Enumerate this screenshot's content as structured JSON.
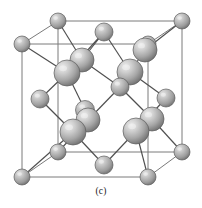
{
  "figure": {
    "caption": "(c)",
    "background_color": "#ffffff",
    "bond_color": "#4a4a4a",
    "cell_edge_color": "#6e6e6e",
    "sphere_color_light": "#d8d8d8",
    "sphere_color_mid": "#a9a9a9",
    "sphere_color_dark": "#6b6b6b",
    "sphere_outline": "#5a5a5a"
  },
  "chart_data": {
    "type": "scatter",
    "xlabel": "",
    "ylabel": "",
    "projection": "oblique",
    "cell": {
      "front_face": [
        [
          22,
          44
        ],
        [
          148,
          44
        ],
        [
          148,
          177
        ],
        [
          22,
          177
        ]
      ],
      "back_face": [
        [
          58,
          21
        ],
        [
          182,
          21
        ],
        [
          182,
          152
        ],
        [
          58,
          152
        ]
      ],
      "depth_offset": [
        36,
        -23
      ]
    },
    "atom_classes": [
      {
        "name": "corner",
        "radius": 8.0,
        "count": 8
      },
      {
        "name": "face-center",
        "radius": 9.0,
        "count": 6
      },
      {
        "name": "interior-tetrahedral",
        "radius": 13.0,
        "count": 4
      }
    ],
    "atoms": [
      {
        "id": "corner-back-top-left",
        "cls": "corner",
        "x": 58,
        "y": 21,
        "r": 8.0
      },
      {
        "id": "corner-back-top-right",
        "cls": "corner",
        "x": 182,
        "y": 21,
        "r": 8.0
      },
      {
        "id": "corner-back-bottom-left",
        "cls": "corner",
        "x": 58,
        "y": 152,
        "r": 8.0
      },
      {
        "id": "corner-back-bottom-right",
        "cls": "corner",
        "x": 182,
        "y": 152,
        "r": 8.0
      },
      {
        "id": "corner-front-top-left",
        "cls": "corner",
        "x": 22,
        "y": 44,
        "r": 8.0
      },
      {
        "id": "corner-front-top-right",
        "cls": "corner",
        "x": 148,
        "y": 44,
        "r": 8.0
      },
      {
        "id": "corner-front-bottom-left",
        "cls": "corner",
        "x": 22,
        "y": 177,
        "r": 8.0
      },
      {
        "id": "corner-front-bottom-right",
        "cls": "corner",
        "x": 148,
        "y": 177,
        "r": 8.0
      },
      {
        "id": "face-top",
        "cls": "face-center",
        "x": 104,
        "y": 32,
        "r": 9.0
      },
      {
        "id": "face-bottom",
        "cls": "face-center",
        "x": 104,
        "y": 165,
        "r": 9.0
      },
      {
        "id": "face-left",
        "cls": "face-center",
        "x": 40,
        "y": 99,
        "r": 9.0
      },
      {
        "id": "face-right",
        "cls": "face-center",
        "x": 166,
        "y": 98,
        "r": 9.0
      },
      {
        "id": "face-front",
        "cls": "face-center",
        "x": 85,
        "y": 110,
        "r": 9.5
      },
      {
        "id": "face-back",
        "cls": "face-center",
        "x": 120,
        "y": 87,
        "r": 9.0
      },
      {
        "id": "interior-upper-left",
        "cls": "interior-tetrahedral",
        "x": 67,
        "y": 73,
        "r": 13.0
      },
      {
        "id": "interior-upper-right",
        "cls": "interior-tetrahedral",
        "x": 130,
        "y": 72,
        "r": 13.0
      },
      {
        "id": "interior-lower-left",
        "cls": "interior-tetrahedral",
        "x": 73,
        "y": 132,
        "r": 13.0
      },
      {
        "id": "interior-lower-right",
        "cls": "interior-tetrahedral",
        "x": 136,
        "y": 131,
        "r": 13.0
      },
      {
        "id": "interior-back-upper-left",
        "cls": "interior-tetrahedral",
        "x": 82,
        "y": 60,
        "r": 12.0
      },
      {
        "id": "interior-back-upper-right",
        "cls": "interior-tetrahedral",
        "x": 145,
        "y": 50,
        "r": 12.0
      },
      {
        "id": "interior-back-lower-left",
        "cls": "interior-tetrahedral",
        "x": 88,
        "y": 120,
        "r": 12.0
      },
      {
        "id": "interior-back-lower-right",
        "cls": "interior-tetrahedral",
        "x": 152,
        "y": 119,
        "r": 12.0
      }
    ],
    "bonds": [
      [
        "interior-upper-left",
        "corner-front-top-left"
      ],
      [
        "interior-upper-left",
        "face-top"
      ],
      [
        "interior-upper-left",
        "face-left"
      ],
      [
        "interior-upper-left",
        "interior-back-upper-left"
      ],
      [
        "interior-back-upper-left",
        "corner-back-top-left"
      ],
      [
        "interior-back-upper-left",
        "face-top"
      ],
      [
        "interior-back-upper-left",
        "face-back"
      ],
      [
        "interior-upper-right",
        "face-top"
      ],
      [
        "interior-upper-right",
        "face-right"
      ],
      [
        "interior-upper-right",
        "face-back"
      ],
      [
        "interior-upper-right",
        "interior-back-upper-right"
      ],
      [
        "interior-back-upper-right",
        "corner-back-top-right"
      ],
      [
        "interior-back-upper-right",
        "corner-front-top-right"
      ],
      [
        "interior-lower-left",
        "face-left"
      ],
      [
        "interior-lower-left",
        "face-bottom"
      ],
      [
        "interior-lower-left",
        "corner-front-bottom-left"
      ],
      [
        "interior-lower-left",
        "interior-back-lower-left"
      ],
      [
        "interior-back-lower-left",
        "corner-back-bottom-left"
      ],
      [
        "interior-back-lower-left",
        "face-back"
      ],
      [
        "interior-back-lower-left",
        "face-front"
      ],
      [
        "interior-lower-right",
        "face-bottom"
      ],
      [
        "interior-lower-right",
        "face-right"
      ],
      [
        "interior-lower-right",
        "corner-front-bottom-right"
      ],
      [
        "interior-lower-right",
        "interior-back-lower-right"
      ],
      [
        "interior-back-lower-right",
        "corner-back-bottom-right"
      ],
      [
        "interior-back-lower-right",
        "face-back"
      ],
      [
        "face-front",
        "interior-upper-left"
      ],
      [
        "face-front",
        "interior-lower-left"
      ]
    ]
  }
}
